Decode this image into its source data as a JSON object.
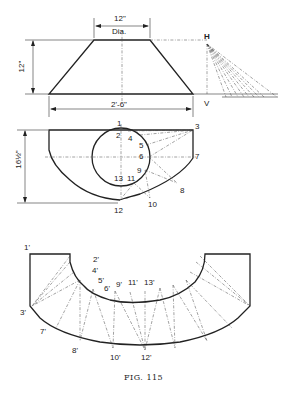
{
  "figure": {
    "caption": "FIG. 115",
    "elevation": {
      "top_dim": "12\"",
      "top_dim_sub": "Dia.",
      "height_dim": "12\"",
      "bottom_dim": "2'-6\"",
      "true_length_top": "H",
      "true_length_bottom": "V"
    },
    "plan": {
      "height_dim": "16½\"",
      "points": [
        "1",
        "2",
        "3",
        "4",
        "5",
        "6",
        "7",
        "8",
        "9",
        "10",
        "11",
        "12",
        "13"
      ]
    },
    "development": {
      "points": [
        "1'",
        "2'",
        "3'",
        "4'",
        "5'",
        "6'",
        "7'",
        "8'",
        "9'",
        "10'",
        "11'",
        "12'",
        "13'"
      ]
    }
  }
}
